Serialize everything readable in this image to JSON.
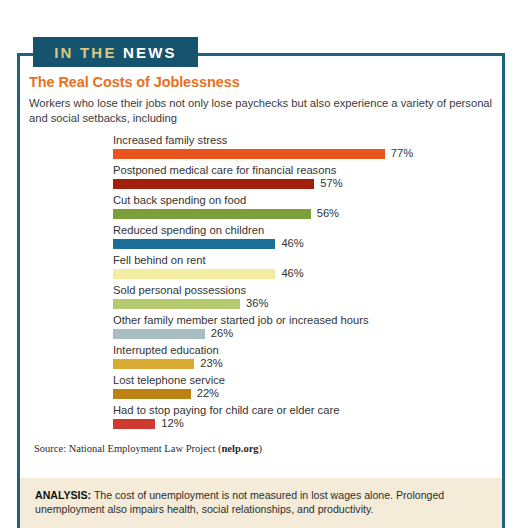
{
  "badge": {
    "part_one": "IN THE",
    "part_two": "NEWS"
  },
  "headline": "The Real Costs of Joblessness",
  "intro": "Workers who lose their jobs not only lose paychecks but also experience a variety of personal and social setbacks, including",
  "source": {
    "prefix": "Source: National Employment Law Project (",
    "link": "nelp.org",
    "suffix": ")"
  },
  "analysis": {
    "label": "ANALYSIS:",
    "text": " The cost of unemployment is not measured in lost wages alone. Prolonged unemployment also impairs health, social relationships, and productivity."
  },
  "colors": {
    "frame": "#1d6380",
    "badge_bg": "#16536e",
    "badge_in": "#d9c87d",
    "badge_news": "#ffffff",
    "headline": "#e8701e",
    "analysis_bg": "#f4ecd9"
  },
  "chart_data": {
    "type": "bar",
    "title": "The Real Costs of Joblessness",
    "xlabel": "",
    "ylabel": "",
    "xlim": [
      0,
      100
    ],
    "grid": false,
    "legend": "none",
    "orientation": "horizontal",
    "value_suffix": "%",
    "categories": [
      "Increased family stress",
      "Postponed medical care for financial reasons",
      "Cut back spending on food",
      "Reduced spending on children",
      "Fell behind on rent",
      "Sold personal possessions",
      "Other family member started job or increased hours",
      "Interrupted education",
      "Lost telephone service",
      "Had to stop paying for child care or elder care"
    ],
    "values": [
      77,
      57,
      56,
      46,
      46,
      36,
      26,
      23,
      22,
      12
    ],
    "value_labels": [
      "77%",
      "57%",
      "56%",
      "46%",
      "46%",
      "36%",
      "26%",
      "23%",
      "22%",
      "12%"
    ],
    "bar_colors": [
      "#e8551f",
      "#a3200f",
      "#7ba03a",
      "#1b6e96",
      "#f2eda0",
      "#b5c96f",
      "#a8bdc0",
      "#d9ab33",
      "#bd8216",
      "#cf3a30"
    ]
  }
}
